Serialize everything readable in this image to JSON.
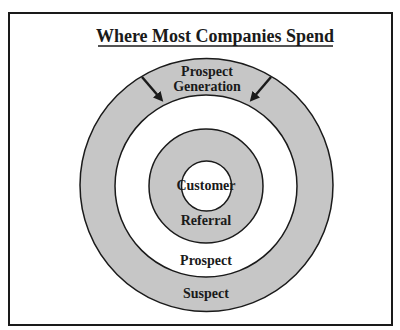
{
  "diagram": {
    "title": "Where Most Companies Spend",
    "rings": [
      {
        "id": "suspect",
        "label": "Suspect",
        "fill": "#c6c6c6"
      },
      {
        "id": "prospect",
        "label": "Prospect",
        "fill": "#ffffff"
      },
      {
        "id": "referral",
        "label": "Referral",
        "fill": "#c6c6c6"
      },
      {
        "id": "customer",
        "label": "Customer",
        "fill": "#ffffff"
      }
    ],
    "top_label_line1": "Prospect",
    "top_label_line2": "Generation",
    "arrows": [
      {
        "id": "left-arrow",
        "direction": "inward"
      },
      {
        "id": "right-arrow",
        "direction": "inward"
      }
    ],
    "colors": {
      "stroke": "#1a1a1a",
      "gray": "#c6c6c6",
      "white": "#ffffff"
    }
  }
}
